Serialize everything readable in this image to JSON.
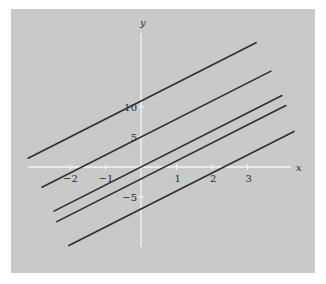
{
  "chart_data": {
    "type": "line",
    "title": "",
    "xlabel": "x",
    "ylabel": "y",
    "x_ticks": [
      -2,
      -1,
      1,
      2,
      3
    ],
    "x_tick_labels": [
      "−2",
      "−1",
      "1",
      "2",
      "3"
    ],
    "y_ticks": [
      10,
      5,
      -5
    ],
    "y_tick_labels": [
      "10",
      "5",
      "−5"
    ],
    "xlim": [
      -3.18,
      4.31
    ],
    "ylim": [
      -13.3,
      22.3
    ],
    "grid": false,
    "legend": null,
    "series": [
      {
        "name": "y = 3x + 11",
        "slope": 3,
        "intercept": 11,
        "x": [
          -3.18,
          3.24
        ],
        "y": [
          1.46,
          20.72
        ]
      },
      {
        "name": "y = 3x + 5",
        "slope": 3,
        "intercept": 5,
        "x": [
          -2.79,
          3.66
        ],
        "y": [
          -3.37,
          15.98
        ]
      },
      {
        "name": "y = 3x",
        "slope": 3,
        "intercept": 0,
        "x": [
          -2.45,
          3.97
        ],
        "y": [
          -7.35,
          11.91
        ]
      },
      {
        "name": "y = 3x - 2",
        "slope": 3,
        "intercept": -2,
        "x": [
          -2.37,
          4.08
        ],
        "y": [
          -9.11,
          10.24
        ]
      },
      {
        "name": "y = 3x - 7",
        "slope": 3,
        "intercept": -7,
        "x": [
          -2.03,
          4.31
        ],
        "y": [
          -13.09,
          5.93
        ]
      }
    ]
  },
  "colors": {
    "page_background": "#ffffff",
    "panel_background": "#c9c9c9",
    "axes": "#f4f4f4",
    "lines": "#2e2e2e",
    "text": "#2a2a2a"
  },
  "layout": {
    "panel": {
      "x": 11,
      "y": 9,
      "w": 304,
      "h": 264
    },
    "origin_px": {
      "x": 141,
      "y": 167
    },
    "px_per_x_unit": 35.5,
    "px_per_y_unit": 6,
    "x_axis_px": [
      28,
      291
    ],
    "y_axis_px": [
      33,
      247
    ]
  }
}
